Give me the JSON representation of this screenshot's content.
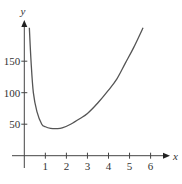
{
  "chart_data": {
    "type": "line",
    "title": "",
    "xlabel": "x",
    "ylabel": "y",
    "xlim": [
      0,
      6.9
    ],
    "ylim": [
      0,
      215
    ],
    "grid": false,
    "legend": null,
    "x_ticks": [
      1,
      2,
      3,
      4,
      5,
      6
    ],
    "y_ticks": [
      50,
      100,
      150
    ],
    "x_tick_labels": [
      "1",
      "2",
      "3",
      "4",
      "5",
      "6"
    ],
    "y_tick_labels": [
      "50",
      "100",
      "150"
    ],
    "series": [
      {
        "name": "curve",
        "color": "#555555",
        "x": [
          0.24,
          0.32,
          0.43,
          0.6,
          0.83,
          1.0,
          1.25,
          1.54,
          1.8,
          2.2,
          2.65,
          3.0,
          3.5,
          4.0,
          4.4,
          4.8,
          5.2,
          5.64
        ],
        "y": [
          203,
          150,
          100,
          70,
          50,
          46,
          43.5,
          43,
          44,
          50,
          59,
          67,
          84,
          104,
          122,
          147,
          172,
          203
        ]
      }
    ]
  }
}
